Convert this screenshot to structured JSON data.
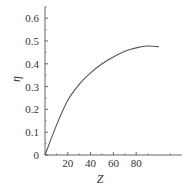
{
  "chart_data": {
    "type": "line",
    "title": "",
    "xlabel": "Z",
    "ylabel": "η",
    "xlim": [
      0,
      120
    ],
    "ylim": [
      0,
      0.65
    ],
    "x_ticks": [
      20,
      40,
      60,
      80
    ],
    "y_ticks": [
      0,
      0.1,
      0.2,
      0.3,
      0.4,
      0.5,
      0.6
    ],
    "x_tick_labels": [
      "20",
      "40",
      "60",
      "80"
    ],
    "y_tick_labels": [
      "0",
      "0.1",
      "0.2",
      "0.3",
      "0.4",
      "0.5",
      "0.6"
    ],
    "grid": false,
    "legend": null,
    "series": [
      {
        "name": "η",
        "x": [
          0,
          10,
          20,
          30,
          40,
          50,
          60,
          70,
          80,
          90,
          100
        ],
        "y": [
          0,
          0.13,
          0.24,
          0.31,
          0.36,
          0.4,
          0.43,
          0.455,
          0.47,
          0.478,
          0.475
        ]
      }
    ]
  },
  "colors": {
    "axis": "#666666",
    "line": "#555555",
    "text": "#333333"
  }
}
